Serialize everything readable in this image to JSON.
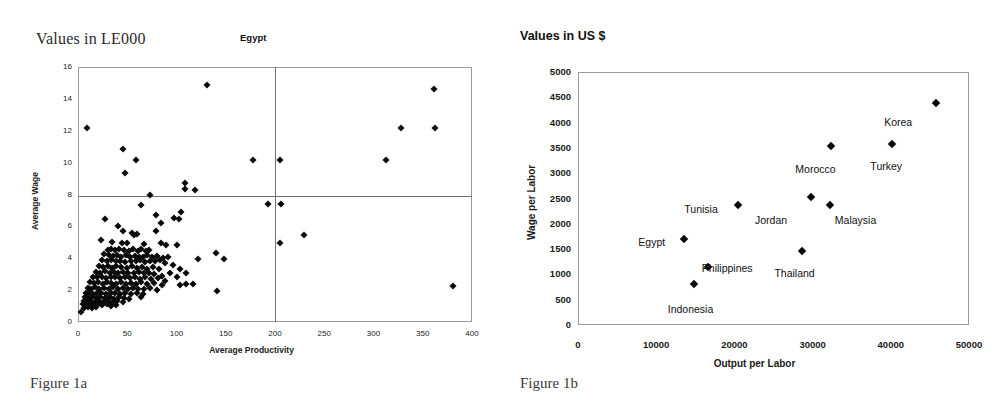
{
  "figure_a": {
    "units_note": "Values in LE000",
    "caption": "Figure 1a",
    "chart_data": {
      "type": "scatter",
      "title": "Egypt",
      "xlabel": "Average Productivity",
      "ylabel": "Average Wage",
      "xlim": [
        0,
        400
      ],
      "ylim": [
        0,
        16
      ],
      "xticks": [
        "0",
        "50",
        "100",
        "150",
        "200",
        "250",
        "300",
        "350",
        "400"
      ],
      "yticks": [
        "0",
        "2",
        "4",
        "6",
        "8",
        "10",
        "12",
        "14",
        "16"
      ],
      "grid": false,
      "legend": "none",
      "reference_lines": [
        {
          "orientation": "vertical",
          "value": 200
        },
        {
          "orientation": "horizontal",
          "value": 7.9
        }
      ],
      "points": [
        [
          9,
          12.2
        ],
        [
          131,
          14.9
        ],
        [
          361,
          14.6
        ],
        [
          328,
          12.15
        ],
        [
          362,
          12.2
        ],
        [
          46,
          10.85
        ],
        [
          59,
          10.15
        ],
        [
          178,
          10.15
        ],
        [
          205,
          10.15
        ],
        [
          313,
          10.15
        ],
        [
          48,
          9.35
        ],
        [
          109,
          8.7
        ],
        [
          109,
          8.35
        ],
        [
          119,
          8.3
        ],
        [
          73,
          7.95
        ],
        [
          193,
          7.4
        ],
        [
          206,
          7.4
        ],
        [
          64,
          7.35
        ],
        [
          105,
          6.9
        ],
        [
          79,
          6.7
        ],
        [
          97,
          6.5
        ],
        [
          103,
          6.45
        ],
        [
          27,
          6.45
        ],
        [
          84,
          6.2
        ],
        [
          229,
          5.45
        ],
        [
          41,
          6.0
        ],
        [
          46,
          5.7
        ],
        [
          55,
          5.6
        ],
        [
          60,
          5.5
        ],
        [
          57,
          5.45
        ],
        [
          79,
          5.7
        ],
        [
          205,
          4.95
        ],
        [
          23,
          5.15
        ],
        [
          35,
          5.0
        ],
        [
          45,
          4.95
        ],
        [
          50,
          4.95
        ],
        [
          67,
          4.9
        ],
        [
          84,
          4.95
        ],
        [
          89,
          4.85
        ],
        [
          100,
          4.85
        ],
        [
          140,
          4.3
        ],
        [
          148,
          3.95
        ],
        [
          122,
          3.95
        ],
        [
          30,
          4.5
        ],
        [
          33,
          4.55
        ],
        [
          38,
          4.5
        ],
        [
          42,
          4.6
        ],
        [
          47,
          4.5
        ],
        [
          52,
          4.45
        ],
        [
          56,
          4.55
        ],
        [
          61,
          4.45
        ],
        [
          64,
          4.6
        ],
        [
          69,
          4.45
        ],
        [
          72,
          4.5
        ],
        [
          26,
          4.25
        ],
        [
          31,
          4.2
        ],
        [
          36,
          4.15
        ],
        [
          40,
          4.2
        ],
        [
          44,
          4.1
        ],
        [
          49,
          4.2
        ],
        [
          53,
          4.1
        ],
        [
          58,
          4.15
        ],
        [
          62,
          4.05
        ],
        [
          66,
          4.1
        ],
        [
          70,
          4.2
        ],
        [
          75,
          4.05
        ],
        [
          80,
          4.15
        ],
        [
          86,
          4.0
        ],
        [
          91,
          4.05
        ],
        [
          24,
          3.9
        ],
        [
          29,
          3.85
        ],
        [
          34,
          3.9
        ],
        [
          39,
          3.8
        ],
        [
          43,
          3.85
        ],
        [
          48,
          3.75
        ],
        [
          54,
          3.85
        ],
        [
          59,
          3.8
        ],
        [
          63,
          3.9
        ],
        [
          68,
          3.75
        ],
        [
          73,
          3.85
        ],
        [
          78,
          3.8
        ],
        [
          83,
          3.9
        ],
        [
          88,
          3.7
        ],
        [
          96,
          3.6
        ],
        [
          104,
          3.3
        ],
        [
          21,
          3.5
        ],
        [
          25,
          3.45
        ],
        [
          30,
          3.5
        ],
        [
          35,
          3.4
        ],
        [
          39,
          3.5
        ],
        [
          44,
          3.45
        ],
        [
          50,
          3.4
        ],
        [
          55,
          3.5
        ],
        [
          60,
          3.4
        ],
        [
          65,
          3.45
        ],
        [
          70,
          3.35
        ],
        [
          76,
          3.45
        ],
        [
          82,
          3.3
        ],
        [
          93,
          3.1
        ],
        [
          110,
          3.05
        ],
        [
          18,
          3.15
        ],
        [
          22,
          3.1
        ],
        [
          27,
          3.2
        ],
        [
          32,
          3.1
        ],
        [
          37,
          3.15
        ],
        [
          41,
          3.05
        ],
        [
          46,
          3.15
        ],
        [
          51,
          3.1
        ],
        [
          57,
          3.05
        ],
        [
          62,
          3.15
        ],
        [
          67,
          3.05
        ],
        [
          72,
          3.1
        ],
        [
          77,
          3.0
        ],
        [
          85,
          2.9
        ],
        [
          100,
          2.8
        ],
        [
          15,
          2.85
        ],
        [
          19,
          2.8
        ],
        [
          24,
          2.85
        ],
        [
          28,
          2.75
        ],
        [
          33,
          2.85
        ],
        [
          38,
          2.8
        ],
        [
          43,
          2.75
        ],
        [
          48,
          2.85
        ],
        [
          53,
          2.75
        ],
        [
          58,
          2.8
        ],
        [
          63,
          2.7
        ],
        [
          68,
          2.8
        ],
        [
          74,
          2.7
        ],
        [
          81,
          2.75
        ],
        [
          88,
          2.6
        ],
        [
          110,
          2.4
        ],
        [
          117,
          2.4
        ],
        [
          12,
          2.5
        ],
        [
          16,
          2.45
        ],
        [
          20,
          2.5
        ],
        [
          25,
          2.4
        ],
        [
          29,
          2.5
        ],
        [
          34,
          2.45
        ],
        [
          39,
          2.4
        ],
        [
          44,
          2.5
        ],
        [
          49,
          2.4
        ],
        [
          54,
          2.45
        ],
        [
          59,
          2.4
        ],
        [
          64,
          2.5
        ],
        [
          70,
          2.4
        ],
        [
          77,
          2.45
        ],
        [
          85,
          2.35
        ],
        [
          104,
          2.3
        ],
        [
          141,
          1.95
        ],
        [
          381,
          2.25
        ],
        [
          10,
          2.15
        ],
        [
          13,
          2.1
        ],
        [
          17,
          2.2
        ],
        [
          21,
          2.1
        ],
        [
          26,
          2.15
        ],
        [
          31,
          2.1
        ],
        [
          36,
          2.2
        ],
        [
          41,
          2.1
        ],
        [
          46,
          2.15
        ],
        [
          51,
          2.05
        ],
        [
          56,
          2.15
        ],
        [
          61,
          2.1
        ],
        [
          67,
          2.05
        ],
        [
          73,
          2.15
        ],
        [
          80,
          2.0
        ],
        [
          8,
          1.8
        ],
        [
          11,
          1.85
        ],
        [
          15,
          1.75
        ],
        [
          19,
          1.85
        ],
        [
          23,
          1.8
        ],
        [
          28,
          1.75
        ],
        [
          33,
          1.85
        ],
        [
          38,
          1.8
        ],
        [
          43,
          1.75
        ],
        [
          48,
          1.85
        ],
        [
          54,
          1.75
        ],
        [
          60,
          1.8
        ],
        [
          66,
          1.75
        ],
        [
          64,
          1.55
        ],
        [
          7,
          1.55
        ],
        [
          10,
          1.5
        ],
        [
          14,
          1.55
        ],
        [
          18,
          1.5
        ],
        [
          22,
          1.55
        ],
        [
          27,
          1.5
        ],
        [
          32,
          1.55
        ],
        [
          37,
          1.45
        ],
        [
          42,
          1.55
        ],
        [
          47,
          1.5
        ],
        [
          52,
          1.45
        ],
        [
          6,
          1.3
        ],
        [
          9,
          1.25
        ],
        [
          13,
          1.3
        ],
        [
          17,
          1.25
        ],
        [
          21,
          1.3
        ],
        [
          25,
          1.25
        ],
        [
          30,
          1.3
        ],
        [
          35,
          1.2
        ],
        [
          40,
          1.3
        ],
        [
          46,
          1.25
        ],
        [
          5,
          1.1
        ],
        [
          8,
          1.05
        ],
        [
          12,
          1.1
        ],
        [
          16,
          1.05
        ],
        [
          20,
          1.1
        ],
        [
          24,
          1.05
        ],
        [
          29,
          1.1
        ],
        [
          34,
          1.0
        ],
        [
          39,
          1.05
        ],
        [
          6,
          0.9
        ],
        [
          10,
          0.92
        ],
        [
          14,
          0.9
        ],
        [
          18,
          0.95
        ],
        [
          3,
          0.6
        ]
      ]
    }
  },
  "figure_b": {
    "units_note": "Values in US $",
    "caption": "Figure 1b",
    "chart_data": {
      "type": "scatter",
      "title": "",
      "xlabel": "Output per Labor",
      "ylabel": "Wage per Labor",
      "xlim": [
        0,
        50000
      ],
      "ylim": [
        0,
        5000
      ],
      "xticks": [
        "0",
        "10000",
        "20000",
        "30000",
        "40000",
        "50000"
      ],
      "yticks": [
        "0",
        "500",
        "1000",
        "1500",
        "2000",
        "2500",
        "3000",
        "3500",
        "4000",
        "4500",
        "5000"
      ],
      "grid": false,
      "legend": "none",
      "points": [
        {
          "name": "Korea",
          "x": 45800,
          "y": 4380,
          "label_dx": -52,
          "label_dy": 13
        },
        {
          "name": "Turkey",
          "x": 40200,
          "y": 3570,
          "label_dx": -22,
          "label_dy": 16
        },
        {
          "name": "Morocco",
          "x": 32400,
          "y": 3530,
          "label_dx": -36,
          "label_dy": 17
        },
        {
          "name": "Jordan",
          "x": 29800,
          "y": 2520,
          "label_dx": -56,
          "label_dy": 17
        },
        {
          "name": "Malaysia",
          "x": 32200,
          "y": 2370,
          "label_dx": 5,
          "label_dy": 9
        },
        {
          "name": "Tunisia",
          "x": 20500,
          "y": 2380,
          "label_dx": -54,
          "label_dy": -2
        },
        {
          "name": "Egypt",
          "x": 13600,
          "y": 1700,
          "label_dx": -46,
          "label_dy": -3
        },
        {
          "name": "Thailand",
          "x": 28700,
          "y": 1460,
          "label_dx": -28,
          "label_dy": 16
        },
        {
          "name": "Philippines",
          "x": 16600,
          "y": 1140,
          "label_dx": -6,
          "label_dy": -5
        },
        {
          "name": "Indonesia",
          "x": 14800,
          "y": 810,
          "label_dx": -26,
          "label_dy": 19
        }
      ]
    }
  }
}
